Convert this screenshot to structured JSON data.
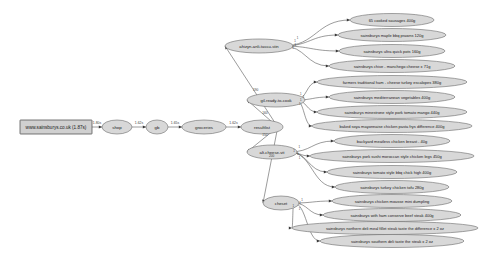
{
  "diagram": {
    "background_color": "#ffffff",
    "node_fill": "#d8d8d8",
    "node_stroke": "#6a6a6a",
    "edge_color": "#4a4a4a",
    "text_color": "#1a1a1a"
  },
  "nodes": {
    "root": {
      "id": "root",
      "label": "www.sainsburys.co.uk (1.87s)",
      "shape": "rectangle",
      "x": 20,
      "y": 120,
      "w": 72,
      "h": 14
    },
    "chain": [
      {
        "id": "shop",
        "label": "shop",
        "shape": "ellipse",
        "cx": 117,
        "cy": 127,
        "rx": 15,
        "ry": 7
      },
      {
        "id": "gb",
        "label": "gb",
        "shape": "ellipse",
        "cx": 157,
        "cy": 127,
        "rx": 11,
        "ry": 7
      },
      {
        "id": "groceries",
        "label": "groceries",
        "shape": "ellipse",
        "cx": 204,
        "cy": 127,
        "rx": 22,
        "ry": 7
      },
      {
        "id": "resultlist",
        "label": "resultlist",
        "shape": "ellipse",
        "cx": 262,
        "cy": 127,
        "rx": 21,
        "ry": 7
      }
    ],
    "categories": [
      {
        "id": "cat-meat-fish",
        "label": "ahizyn-anli-tassu-stin",
        "shape": "ellipse",
        "cx": 259,
        "cy": 46,
        "rx": 34,
        "ry": 7
      },
      {
        "id": "cat-ready-meals",
        "label": "gil-ready-to-cook",
        "shape": "ellipse",
        "cx": 276,
        "cy": 100,
        "rx": 29,
        "ry": 7
      },
      {
        "id": "cat-dairy",
        "label": "alt-cheese-vit",
        "shape": "ellipse",
        "cx": 272,
        "cy": 152,
        "rx": 25,
        "ry": 7
      },
      {
        "id": "cat-bread",
        "label": "cheset",
        "shape": "ellipse",
        "cx": 281,
        "cy": 203,
        "rx": 18,
        "ry": 7
      }
    ],
    "leaves": [
      {
        "id": "leaf-1",
        "parent": "cat-meat-fish",
        "label": "65 cooked sausages 400g",
        "cx": 392,
        "cy": 20,
        "rx": 42,
        "ry": 6.5
      },
      {
        "id": "leaf-2",
        "parent": "cat-meat-fish",
        "label": "sainsburys maple bbq prawns 120g",
        "cx": 392,
        "cy": 35,
        "rx": 54,
        "ry": 6.5
      },
      {
        "id": "leaf-3",
        "parent": "cat-meat-fish",
        "label": "sainsburys ultra quick pots 160g",
        "cx": 392,
        "cy": 51,
        "rx": 53,
        "ry": 6.5
      },
      {
        "id": "leaf-4",
        "parent": "cat-meat-fish",
        "label": "sainsburys chive - manchego cheese x 71g",
        "cx": 392,
        "cy": 66,
        "rx": 63,
        "ry": 6.5
      },
      {
        "id": "leaf-5",
        "parent": "cat-ready-meals",
        "label": "farmers traditional ham - cheese turkey escalopes 380g",
        "cx": 392,
        "cy": 82,
        "rx": 75,
        "ry": 6.5
      },
      {
        "id": "leaf-6",
        "parent": "cat-ready-meals",
        "label": "sainsburys mediterranean vegetables 400g",
        "cx": 392,
        "cy": 97,
        "rx": 63,
        "ry": 6.5
      },
      {
        "id": "leaf-7",
        "parent": "cat-ready-meals",
        "label": "sainsburys minestrone style pork tomato mango 440g",
        "cx": 392,
        "cy": 112,
        "rx": 75,
        "ry": 6.5
      },
      {
        "id": "leaf-8",
        "parent": "cat-ready-meals",
        "label": "baked soya mayonnaise chicken pasta frys difference 400g",
        "cx": 392,
        "cy": 126,
        "rx": 80,
        "ry": 6.5
      },
      {
        "id": "leaf-9",
        "parent": "cat-dairy",
        "label": "backyard meatless chicken breast - 40g",
        "cx": 392,
        "cy": 141,
        "rx": 58,
        "ry": 6.5
      },
      {
        "id": "leaf-10",
        "parent": "cat-dairy",
        "label": "sainsburys pork sushi moroccan style chicken legs 450g",
        "cx": 392,
        "cy": 156,
        "rx": 82,
        "ry": 6.5
      },
      {
        "id": "leaf-11",
        "parent": "cat-dairy",
        "label": "sainsburys tomato style bbq chick high 400g",
        "cx": 392,
        "cy": 172,
        "rx": 65,
        "ry": 6.5
      },
      {
        "id": "leaf-12",
        "parent": "cat-dairy",
        "label": "sainsburys turkey chicken tofu 280g",
        "cx": 392,
        "cy": 187,
        "rx": 57,
        "ry": 6.5
      },
      {
        "id": "leaf-13",
        "parent": "cat-bread",
        "label": "sainsburys chicken mousse mini dumpling",
        "cx": 392,
        "cy": 201,
        "rx": 60,
        "ry": 6.5
      },
      {
        "id": "leaf-14",
        "parent": "cat-bread",
        "label": "sainsburys with ham conserve beef steak 400g",
        "cx": 392,
        "cy": 215,
        "rx": 69,
        "ry": 6.5
      },
      {
        "id": "leaf-15",
        "parent": "cat-bread",
        "label": "sainsburys northern deli meal fillet steak taste the difference x 2 oz",
        "cx": 385,
        "cy": 228,
        "rx": 93,
        "ry": 6.5
      },
      {
        "id": "leaf-16",
        "parent": "cat-bread",
        "label": "sainsburys southern deli taste the steak x 2 oz",
        "cx": 392,
        "cy": 241,
        "rx": 72,
        "ry": 6.5
      }
    ]
  },
  "edges": {
    "chain_labels": [
      "1.80s",
      "1.62s",
      "1.65s",
      "1.62s"
    ],
    "hub_labels": [
      "190",
      "160",
      "150",
      "200"
    ],
    "leaf_label": "1"
  }
}
